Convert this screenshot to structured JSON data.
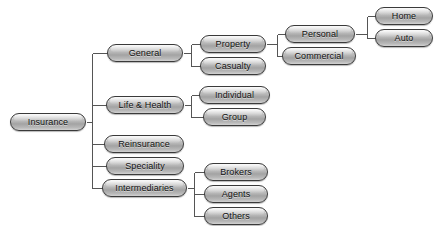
{
  "diagram": {
    "type": "hierarchy-tree",
    "colors": {
      "background": "#ffffff",
      "node_fill_light": "#e9e9e9",
      "node_fill_mid": "#b4b4b4",
      "node_fill_dark": "#a3a3a3",
      "node_border": "#3a3a3a",
      "connector": "#555555",
      "label_text": "#111111"
    },
    "nodes": [
      {
        "id": "insurance",
        "label": "Insurance",
        "level": 0,
        "x": 10,
        "y": 113,
        "w": 76
      },
      {
        "id": "general",
        "label": "General",
        "level": 1,
        "x": 107,
        "y": 44,
        "w": 76
      },
      {
        "id": "life_health",
        "label": "Life & Health",
        "level": 1,
        "x": 106,
        "y": 96,
        "w": 78
      },
      {
        "id": "reinsurance",
        "label": "Reinsurance",
        "level": 1,
        "x": 104,
        "y": 135,
        "w": 80
      },
      {
        "id": "speciality",
        "label": "Speciality",
        "level": 1,
        "x": 106,
        "y": 157,
        "w": 78
      },
      {
        "id": "intermediaries",
        "label": "Intermediaries",
        "level": 1,
        "x": 102,
        "y": 179,
        "w": 85
      },
      {
        "id": "property",
        "label": "Property",
        "level": 2,
        "x": 200,
        "y": 35,
        "w": 66
      },
      {
        "id": "casualty",
        "label": "Casualty",
        "level": 2,
        "x": 200,
        "y": 57,
        "w": 66
      },
      {
        "id": "individual",
        "label": "Individual",
        "level": 2,
        "x": 199,
        "y": 86,
        "w": 71
      },
      {
        "id": "group",
        "label": "Group",
        "level": 2,
        "x": 203,
        "y": 108,
        "w": 63
      },
      {
        "id": "brokers",
        "label": "Brokers",
        "level": 2,
        "x": 204,
        "y": 163,
        "w": 64
      },
      {
        "id": "agents",
        "label": "Agents",
        "level": 2,
        "x": 204,
        "y": 185,
        "w": 64
      },
      {
        "id": "others",
        "label": "Others",
        "level": 2,
        "x": 204,
        "y": 207,
        "w": 64
      },
      {
        "id": "personal",
        "label": "Personal",
        "level": 3,
        "x": 285,
        "y": 25,
        "w": 70
      },
      {
        "id": "commercial",
        "label": "Commercial",
        "level": 3,
        "x": 282,
        "y": 47,
        "w": 74
      },
      {
        "id": "home",
        "label": "Home",
        "level": 4,
        "x": 375,
        "y": 7,
        "w": 58
      },
      {
        "id": "auto",
        "label": "Auto",
        "level": 4,
        "x": 375,
        "y": 29,
        "w": 58
      }
    ],
    "edges": [
      {
        "from": "insurance",
        "to": [
          "general",
          "life_health",
          "reinsurance",
          "speciality",
          "intermediaries"
        ]
      },
      {
        "from": "general",
        "to": [
          "property",
          "casualty"
        ]
      },
      {
        "from": "life_health",
        "to": [
          "individual",
          "group"
        ]
      },
      {
        "from": "intermediaries",
        "to": [
          "brokers",
          "agents",
          "others"
        ]
      },
      {
        "from": "property",
        "to": [
          "personal",
          "commercial"
        ]
      },
      {
        "from": "personal",
        "to": [
          "home",
          "auto"
        ]
      }
    ]
  }
}
